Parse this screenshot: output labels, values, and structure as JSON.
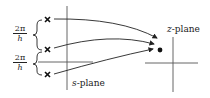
{
  "diagram": {
    "s_plane": {
      "label_var": "s",
      "label_suffix": "-plane",
      "poles": [
        {
          "marker": "×",
          "y": 19
        },
        {
          "marker": "×",
          "y": 50
        },
        {
          "marker": "×",
          "y": 75
        }
      ],
      "spacing_labels": [
        {
          "numerator": "2π",
          "denominator": "h"
        },
        {
          "numerator": "2π",
          "denominator": "h"
        }
      ]
    },
    "z_plane": {
      "label_var": "z",
      "label_suffix": "-plane",
      "mapped_point": "•"
    },
    "arrows": 3,
    "colors": {
      "stroke": "#222222",
      "background": "#ffffff"
    }
  }
}
